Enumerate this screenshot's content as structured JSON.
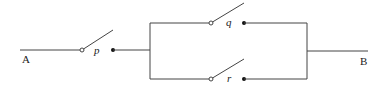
{
  "diagram": {
    "type": "switching-circuit",
    "terminals": {
      "left": "A",
      "right": "B"
    },
    "switches": [
      {
        "id": "p",
        "label": "p",
        "position": "series",
        "state": "open"
      },
      {
        "id": "q",
        "label": "q",
        "position": "parallel-top",
        "state": "open"
      },
      {
        "id": "r",
        "label": "r",
        "position": "parallel-bottom",
        "state": "open"
      }
    ],
    "topology": "p in series with (q parallel r)"
  }
}
